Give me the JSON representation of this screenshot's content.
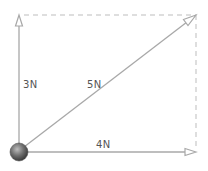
{
  "diagram": {
    "colors": {
      "arrow": "#a8a8a8",
      "dashed": "#bdbdbd",
      "ball": "#6e6e6e",
      "label": "#555555"
    },
    "forces": [
      {
        "id": "vertical",
        "label": "3N",
        "direction": "up"
      },
      {
        "id": "diagonal",
        "label": "5N",
        "direction": "up-right"
      },
      {
        "id": "horizontal",
        "label": "4N",
        "direction": "right"
      }
    ],
    "object": "ball"
  }
}
